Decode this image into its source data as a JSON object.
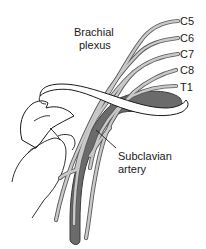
{
  "figure": {
    "title_label": {
      "line1": "Brachial",
      "line2": "plexus"
    },
    "nerve_roots": [
      {
        "label": "C5"
      },
      {
        "label": "C6"
      },
      {
        "label": "C7"
      },
      {
        "label": "C8"
      },
      {
        "label": "T1"
      }
    ],
    "artery_label": {
      "line1": "Subclavian",
      "line2": "artery"
    },
    "structures": [
      "clavicle",
      "scapula",
      "first-rib",
      "subclavian-artery",
      "brachial-plexus-nerves"
    ],
    "colors": {
      "nerve_outline": "#5a5a5a",
      "nerve_fill": "#c9c9c9",
      "artery": "#6b6b6b",
      "bone_outline": "#1a1a1a",
      "background": "#ffffff"
    }
  }
}
